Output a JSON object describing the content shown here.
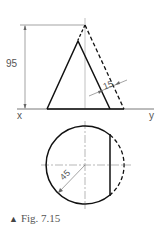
{
  "figure": {
    "caption_marker": "▲",
    "caption": "Fig. 7.15",
    "labels": {
      "height_dim": "95",
      "slant_dim": "15",
      "radius_dim": "45",
      "x_label": "x",
      "y_label": "y"
    },
    "colors": {
      "line": "#111111",
      "thin": "#666666",
      "text": "#555555"
    }
  }
}
